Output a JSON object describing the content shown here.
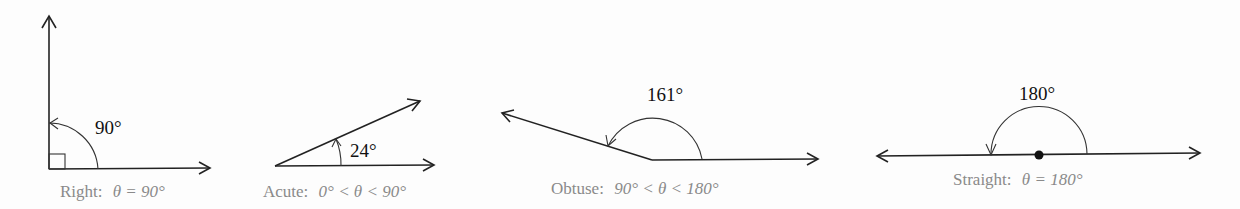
{
  "diagram": {
    "angles": [
      {
        "name": "right",
        "measure_label": "90°",
        "caption_prefix": "Right:",
        "caption_math": "θ = 90°"
      },
      {
        "name": "acute",
        "measure_label": "24°",
        "caption_prefix": "Acute:",
        "caption_math": "0° < θ < 90°"
      },
      {
        "name": "obtuse",
        "measure_label": "161°",
        "caption_prefix": "Obtuse:",
        "caption_math": "90° < θ < 180°"
      },
      {
        "name": "straight",
        "measure_label": "180°",
        "caption_prefix": "Straight:",
        "caption_math": "θ = 180°"
      }
    ]
  },
  "colors": {
    "line": "#222222",
    "caption": "#8a8a8a",
    "background": "#fdfdfd"
  }
}
